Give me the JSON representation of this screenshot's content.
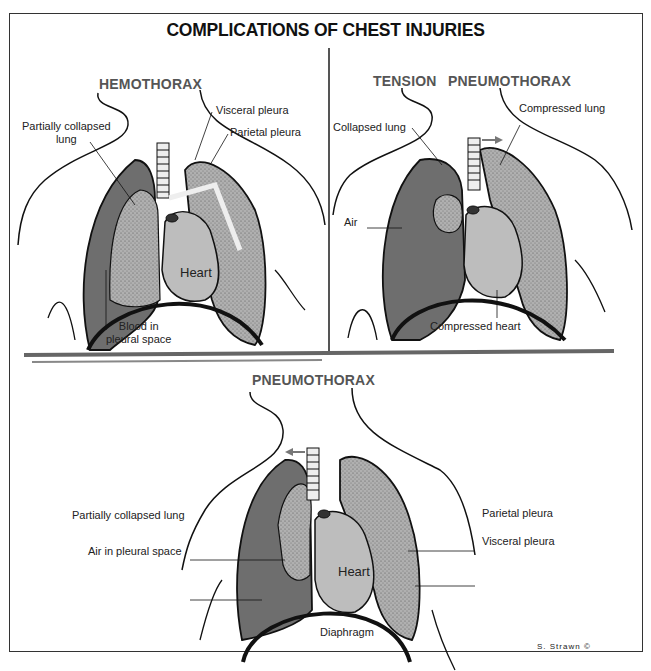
{
  "title": "COMPLICATIONS OF CHEST INJURIES",
  "panels": [
    {
      "name": "hemothorax",
      "title": "HEMOTHORAX",
      "labels": {
        "partially_collapsed_lung_1": "Partially collapsed",
        "partially_collapsed_lung_2": "lung",
        "visceral_pleura": "Visceral pleura",
        "parietal_pleura": "Parietal pleura",
        "heart": "Heart",
        "blood_1": "Blood in",
        "blood_2": "pleural space"
      }
    },
    {
      "name": "tension-pneumothorax",
      "title_1": "TENSION",
      "title_2": "PNEUMOTHORAX",
      "labels": {
        "collapsed_lung": "Collapsed lung",
        "compressed_lung": "Compressed lung",
        "air": "Air",
        "compressed_heart": "Compressed heart"
      }
    },
    {
      "name": "pneumothorax",
      "title": "PNEUMOTHORAX",
      "labels": {
        "partially_collapsed_lung": "Partially collapsed lung",
        "air_in_pleural_space": "Air in pleural space",
        "parietal_pleura": "Parietal pleura",
        "visceral_pleura": "Visceral pleura",
        "heart": "Heart",
        "diaphragm": "Diaphragm"
      }
    }
  ],
  "signature": "S. Strawn ©",
  "colors": {
    "blood_air_fill": "#6e6e6e",
    "lung_fill": "#a9a9a9",
    "heart_fill": "#bdbdbd",
    "outline": "#111111",
    "divider": "#555555"
  }
}
